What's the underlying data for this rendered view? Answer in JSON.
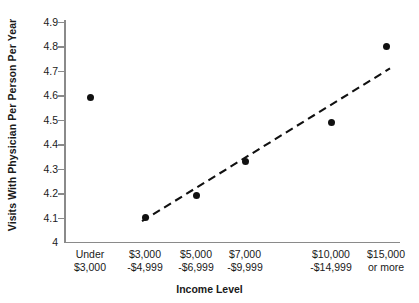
{
  "chart_data": {
    "type": "scatter",
    "title": "",
    "xlabel": "Income Level",
    "ylabel": "Visits With Physician Per Person Per Year",
    "categories": [
      "Under $3,000",
      "$3,000 -$4,999",
      "$5,000 -$6,999",
      "$7,000 -$9,999",
      "$10,000 -$14,999",
      "$15,000 or more"
    ],
    "category_lines": [
      [
        "Under",
        "$3,000"
      ],
      [
        "$3,000",
        "-$4,999"
      ],
      [
        "$5,000",
        "-$6,999"
      ],
      [
        "$7,000",
        "-$9,999"
      ],
      [
        "$10,000",
        "-$14,999"
      ],
      [
        "$15,000",
        "or more"
      ]
    ],
    "values": [
      4.59,
      4.1,
      4.19,
      4.33,
      4.49,
      4.8
    ],
    "ylim": [
      4.0,
      4.9
    ],
    "yticks": [
      4.9,
      4.8,
      4.7,
      4.6,
      4.5,
      4.4,
      4.3,
      4.2,
      4.1,
      4.0
    ],
    "ytick_labels": [
      "4.9",
      "4.8",
      "4.7",
      "4.6",
      "4.5",
      "4.4",
      "4.3",
      "4.2",
      "4.1",
      "4"
    ],
    "grid": false,
    "legend": "none",
    "trendline": {
      "style": "dashed",
      "from": {
        "category_index": 1,
        "value": 4.085
      },
      "to": {
        "category_index": 5,
        "value": 4.71
      }
    },
    "colors": {
      "marker": "#111111",
      "axis": "#8a8a8a",
      "text": "#1a1a1a",
      "background": "#ffffff",
      "trendline": "#111111"
    }
  }
}
